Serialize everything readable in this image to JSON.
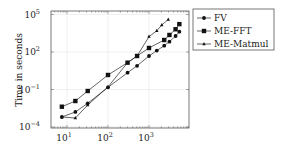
{
  "chart_data": {
    "type": "line",
    "title": "",
    "xlabel": "",
    "ylabel": "Time in seconds",
    "xscale": "log",
    "yscale": "log",
    "xlim": [
      5,
      6500
    ],
    "ylim": [
      5e-05,
      100000
    ],
    "grid": true,
    "legend_position": "outside-right-top",
    "x_ticks": [
      {
        "value": 10,
        "label_base": "10",
        "label_exp": "1"
      },
      {
        "value": 100,
        "label_base": "10",
        "label_exp": "2"
      },
      {
        "value": 1000,
        "label_base": "10",
        "label_exp": "3"
      }
    ],
    "y_ticks": [
      {
        "value": 0.0001,
        "label_base": "10",
        "label_exp": "−4"
      },
      {
        "value": 0.1,
        "label_base": "10",
        "label_exp": "−1"
      },
      {
        "value": 100,
        "label_base": "10",
        "label_exp": "2"
      },
      {
        "value": 100000,
        "label_base": "10",
        "label_exp": "5"
      }
    ],
    "series": [
      {
        "name": "FV",
        "marker": "circle",
        "x": [
          7.5,
          16,
          32,
          100,
          300,
          512,
          1000,
          1550,
          2350,
          3150,
          4450,
          5500
        ],
        "y": [
          0.00063,
          0.0016,
          0.0079,
          0.15,
          2.2,
          7.9,
          48,
          130,
          320,
          670,
          1900,
          4200
        ]
      },
      {
        "name": "ME-FFT",
        "marker": "square",
        "x": [
          7.5,
          16,
          32,
          100,
          300,
          512,
          1000,
          2350,
          3150,
          4450,
          5500
        ],
        "y": [
          0.0042,
          0.012,
          0.076,
          1.45,
          14,
          48,
          210,
          910,
          2300,
          6600,
          17000
        ]
      },
      {
        "name": "ME-Matmul",
        "marker": "triangle",
        "x": [
          7.5,
          16,
          32,
          100,
          300,
          512,
          1000,
          1550,
          2050,
          2950
        ],
        "y": [
          0.00063,
          0.00052,
          0.0058,
          0.16,
          14,
          48,
          1700,
          5000,
          14500,
          40000
        ]
      }
    ]
  }
}
